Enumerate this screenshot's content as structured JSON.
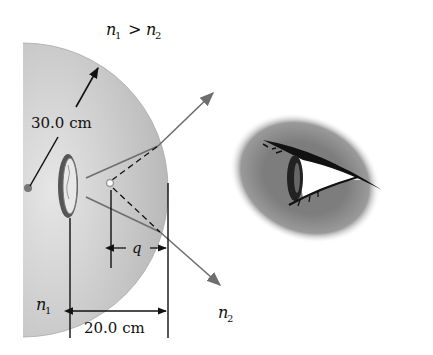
{
  "figure": {
    "condition_label": "n",
    "labels": {
      "n1_gt_n2": {
        "a": "n",
        "sub1": "1",
        "op": " > ",
        "b": "n",
        "sub2": "2"
      },
      "radius": "30.0 cm",
      "q": "q",
      "distance": "20.0 cm",
      "n1": {
        "base": "n",
        "sub": "1"
      },
      "n2": {
        "base": "n",
        "sub": "2"
      }
    },
    "colors": {
      "sphere_fill": "#c8c8c8",
      "ray": "#6e6e6e",
      "line": "#111111",
      "eye_shadow": "#8a8a8a"
    }
  }
}
